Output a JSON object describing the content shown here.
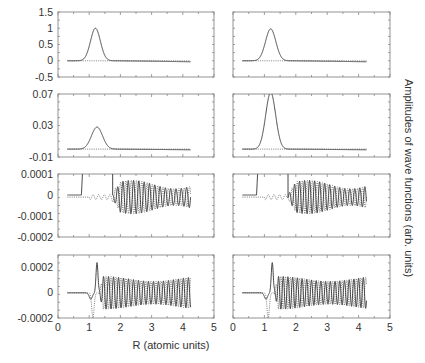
{
  "figure": {
    "xlabel": "R (atomic units)",
    "ylabel": "Amplitudes of wave functions (arb. units)"
  },
  "chart_data": {
    "type": "line",
    "title": "",
    "xlabel": "R (atomic units)",
    "ylabel": "Amplitudes of wave functions (arb. units)",
    "layout": {
      "rows": 4,
      "cols": 2,
      "shared_x": true,
      "grid": false,
      "legend": "none"
    },
    "xlim": [
      0,
      5
    ],
    "xticks": [
      "0",
      "1",
      "2",
      "3",
      "4",
      "5"
    ],
    "panels": [
      {
        "row": 0,
        "col": 0,
        "ylim": [
          -0.5,
          1.5
        ],
        "yticks": [
          "1.5",
          "1",
          "0.5",
          "0",
          "-0.5"
        ],
        "series": [
          {
            "name": "solid",
            "style": "solid",
            "desc": "Gaussian-like peak",
            "peak_x": 1.2,
            "peak_y": 1.0,
            "width": 0.25,
            "x_range": [
              0.3,
              4.25
            ]
          },
          {
            "name": "dotted",
            "style": "dotted",
            "desc": "flat near zero",
            "y": 0
          }
        ]
      },
      {
        "row": 0,
        "col": 1,
        "ylim": [
          -0.5,
          1.5
        ],
        "yticks": [],
        "series": [
          {
            "name": "solid",
            "style": "solid",
            "peak_x": 1.2,
            "peak_y": 0.98,
            "width": 0.26,
            "x_range": [
              0.3,
              4.25
            ]
          },
          {
            "name": "dotted",
            "style": "dotted",
            "y": 0
          }
        ]
      },
      {
        "row": 1,
        "col": 0,
        "ylim": [
          -0.01,
          0.07
        ],
        "yticks": [
          "0.07",
          "0.03",
          "-0.01"
        ],
        "series": [
          {
            "name": "solid",
            "style": "solid",
            "peak_x": 1.25,
            "peak_y": 0.028,
            "width": 0.28,
            "x_range": [
              0.3,
              4.25
            ]
          },
          {
            "name": "dotted",
            "style": "dotted",
            "y": 0
          }
        ]
      },
      {
        "row": 1,
        "col": 1,
        "ylim": [
          -0.01,
          0.07
        ],
        "yticks": [],
        "series": [
          {
            "name": "solid",
            "style": "solid",
            "peak_x": 1.2,
            "peak_y": 0.072,
            "width": 0.25,
            "x_range": [
              0.3,
              4.25
            ]
          },
          {
            "name": "dotted",
            "style": "dotted",
            "y": 0
          }
        ]
      },
      {
        "row": 2,
        "col": 0,
        "ylim": [
          -0.0002,
          0.0001
        ],
        "yticks": [
          "0.0001",
          "0",
          "-0.0001",
          "-0.0002"
        ],
        "series": [
          {
            "name": "solid",
            "style": "solid",
            "desc": "rises off-scale near R=0.8, returns ~1.7, oscillates",
            "osc_amp": 8e-05,
            "osc_period": 0.17,
            "x_range": [
              0.3,
              4.25
            ]
          },
          {
            "name": "dotted",
            "style": "dotted",
            "desc": "small wiggles then oscillation",
            "osc_amp": 8e-05,
            "x_range": [
              0.3,
              4.25
            ]
          }
        ]
      },
      {
        "row": 2,
        "col": 1,
        "ylim": [
          -0.0002,
          0.0001
        ],
        "yticks": [],
        "series": [
          {
            "name": "solid",
            "style": "solid",
            "osc_amp": 8e-05,
            "osc_period": 0.16,
            "x_range": [
              0.3,
              4.25
            ]
          },
          {
            "name": "dotted",
            "style": "dotted",
            "osc_amp": 8e-05,
            "x_range": [
              0.3,
              4.25
            ]
          }
        ]
      },
      {
        "row": 3,
        "col": 0,
        "ylim": [
          -0.0002,
          0.0003
        ],
        "yticks": [
          "0.0002",
          "0",
          "-0.0002"
        ],
        "series": [
          {
            "name": "solid",
            "style": "solid",
            "desc": "dip at 1.05, spike to 0.00024 at 1.25, damped oscillation ~0.00013",
            "osc_amp": 0.00013,
            "osc_period": 0.16,
            "x_range": [
              0.3,
              4.25
            ]
          },
          {
            "name": "dotted",
            "style": "dotted",
            "desc": "dip to -0.0002 at 1.1 then oscillation",
            "osc_amp": 0.00013,
            "x_range": [
              0.3,
              4.25
            ]
          }
        ]
      },
      {
        "row": 3,
        "col": 1,
        "ylim": [
          -0.0002,
          0.0003
        ],
        "yticks": [],
        "series": [
          {
            "name": "solid",
            "style": "solid",
            "osc_amp": 0.00013,
            "osc_period": 0.15,
            "x_range": [
              0.3,
              4.25
            ]
          },
          {
            "name": "dotted",
            "style": "dotted",
            "osc_amp": 0.00013,
            "x_range": [
              0.3,
              4.25
            ]
          }
        ]
      }
    ]
  }
}
